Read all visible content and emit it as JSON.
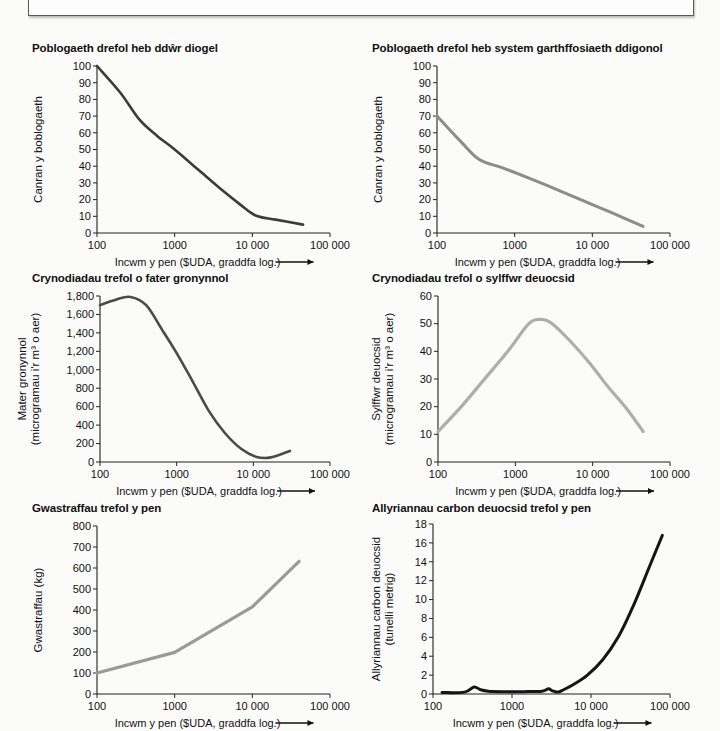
{
  "figure": {
    "top_box_label": "",
    "x_axis_title": "Incwm y pen ($UDA, graddfa log.)",
    "x_tick_labels": [
      "100",
      "1000",
      "10 000",
      "100 000"
    ]
  },
  "chart_data": [
    {
      "id": "chart-1",
      "type": "line",
      "title": "Poblogaeth drefol heb ddŵr diogel",
      "xlabel": "Incwm y pen ($UDA, graddfa log.)",
      "ylabel": "Canran y boblogaeth",
      "xscale": "log",
      "xlim": [
        100,
        100000
      ],
      "ylim": [
        0,
        100
      ],
      "xticks": [
        100,
        1000,
        10000,
        100000
      ],
      "xticklabels": [
        "100",
        "1000",
        "10 000",
        "100 000"
      ],
      "yticks": [
        0,
        10,
        20,
        30,
        40,
        50,
        60,
        70,
        80,
        90,
        100
      ],
      "yticklabels": [
        "0",
        "10",
        "20",
        "30",
        "40",
        "50",
        "60",
        "70",
        "80",
        "90",
        "100"
      ],
      "grid": false,
      "legend": "none",
      "color": "#3b3b3b",
      "linewidth": 2.6,
      "x": [
        100,
        200,
        350,
        600,
        1000,
        2000,
        4000,
        7000,
        11000,
        20000,
        45000
      ],
      "y": [
        100,
        84,
        68,
        58,
        50,
        38,
        26,
        17,
        10.5,
        8,
        5
      ]
    },
    {
      "id": "chart-2",
      "type": "line",
      "title": "Poblogaeth drefol heb system garthffosiaeth ddigonol",
      "xlabel": "Incwm y pen ($UDA, graddfa log.)",
      "ylabel": "Canran y boblogaeth",
      "xscale": "log",
      "xlim": [
        100,
        100000
      ],
      "ylim": [
        0,
        100
      ],
      "xticks": [
        100,
        1000,
        10000,
        100000
      ],
      "xticklabels": [
        "100",
        "1000",
        "10 000",
        "100 000"
      ],
      "yticks": [
        0,
        10,
        20,
        30,
        40,
        50,
        60,
        70,
        80,
        90,
        100
      ],
      "yticklabels": [
        "0",
        "10",
        "20",
        "30",
        "40",
        "50",
        "60",
        "70",
        "80",
        "90",
        "100"
      ],
      "grid": false,
      "legend": "none",
      "color": "#8c8c8c",
      "linewidth": 3.0,
      "x": [
        100,
        200,
        350,
        700,
        1500,
        3500,
        8000,
        18000,
        45000
      ],
      "y": [
        70,
        55,
        44,
        39,
        33,
        26,
        19,
        12,
        4
      ]
    },
    {
      "id": "chart-3",
      "type": "line",
      "title": "Crynodiadau trefol o fater gronynnol",
      "xlabel": "Incwm y pen ($UDA, graddfa log.)",
      "ylabel": "Mater gronynnol (microgramau i'r m³ o aer)",
      "xscale": "log",
      "xlim": [
        100,
        100000
      ],
      "ylim": [
        0,
        1800
      ],
      "xticks": [
        100,
        1000,
        10000,
        100000
      ],
      "xticklabels": [
        "100",
        "1000",
        "10 000",
        "100 000"
      ],
      "yticks": [
        0,
        200,
        400,
        600,
        800,
        1000,
        1200,
        1400,
        1600,
        1800
      ],
      "yticklabels": [
        "0",
        "200",
        "400",
        "600",
        "800",
        "1,000",
        "1,200",
        "1,400",
        "1,600",
        "1,800"
      ],
      "grid": false,
      "legend": "none",
      "color": "#4a4a4a",
      "linewidth": 2.6,
      "x": [
        100,
        160,
        250,
        400,
        650,
        1000,
        1600,
        2600,
        4200,
        7000,
        11000,
        17000,
        30000
      ],
      "y": [
        1700,
        1760,
        1790,
        1700,
        1430,
        1180,
        880,
        560,
        320,
        140,
        55,
        50,
        120
      ]
    },
    {
      "id": "chart-4",
      "type": "line",
      "title": "Crynodiadau trefol o sylffwr deuocsid",
      "xlabel": "Incwm y pen ($UDA, graddfa log.)",
      "ylabel": "Sylffwr deuocsid (microgramau i'r m³ o aer)",
      "xscale": "log",
      "xlim": [
        100,
        100000
      ],
      "ylim": [
        0,
        60
      ],
      "xticks": [
        100,
        1000,
        10000,
        100000
      ],
      "xticklabels": [
        "100",
        "1000",
        "10 000",
        "100 000"
      ],
      "yticks": [
        0,
        10,
        20,
        30,
        40,
        50,
        60
      ],
      "yticklabels": [
        "0",
        "10",
        "20",
        "30",
        "40",
        "50",
        "60"
      ],
      "grid": false,
      "legend": "none",
      "color": "#adadad",
      "linewidth": 3.2,
      "x": [
        100,
        200,
        400,
        800,
        1500,
        2200,
        3000,
        5000,
        9000,
        16000,
        28000,
        45000
      ],
      "y": [
        11,
        20,
        30,
        40,
        50,
        51.5,
        50,
        44,
        36,
        27,
        19,
        11
      ]
    },
    {
      "id": "chart-5",
      "type": "line",
      "title": "Gwastraffau trefol y pen",
      "xlabel": "Incwm y pen ($UDA, graddfa log.)",
      "ylabel": "Gwastraffau (kg)",
      "xscale": "log",
      "xlim": [
        100,
        100000
      ],
      "ylim": [
        0,
        800
      ],
      "xticks": [
        100,
        1000,
        10000,
        100000
      ],
      "xticklabels": [
        "100",
        "1000",
        "10 000",
        "100 000"
      ],
      "yticks": [
        0,
        100,
        200,
        300,
        400,
        500,
        600,
        700,
        800
      ],
      "yticklabels": [
        "0",
        "100",
        "200",
        "300",
        "400",
        "500",
        "600",
        "700",
        "800"
      ],
      "grid": false,
      "legend": "none",
      "color": "#9a9a9a",
      "linewidth": 3.2,
      "x": [
        100,
        1000,
        10000,
        40000
      ],
      "y": [
        100,
        198,
        415,
        632
      ]
    },
    {
      "id": "chart-6",
      "type": "line",
      "title": "Allyriannau carbon deuocsid trefol y pen",
      "xlabel": "Incwm y pen ($UDA, graddfa log.)",
      "ylabel": "Allyriannau carbon deuocsid (tunelli metrig)",
      "xscale": "log",
      "xlim": [
        100,
        100000
      ],
      "ylim": [
        0,
        18
      ],
      "xticks": [
        100,
        1000,
        10000,
        100000
      ],
      "xticklabels": [
        "100",
        "1000",
        "10 000",
        "100 000"
      ],
      "yticks": [
        0,
        2,
        4,
        6,
        8,
        10,
        12,
        14,
        16,
        18
      ],
      "yticklabels": [
        "0",
        "2",
        "4",
        "6",
        "8",
        "10",
        "12",
        "14",
        "16",
        "18"
      ],
      "grid": false,
      "legend": "none",
      "color": "#151515",
      "linewidth": 3.0,
      "x": [
        130,
        250,
        330,
        400,
        500,
        800,
        1400,
        2400,
        2900,
        3200,
        3800,
        4500,
        6000,
        9000,
        14000,
        22000,
        35000,
        55000,
        80000
      ],
      "y": [
        0.15,
        0.2,
        0.75,
        0.45,
        0.3,
        0.25,
        0.25,
        0.3,
        0.55,
        0.35,
        0.2,
        0.45,
        1.0,
        2.0,
        3.6,
        6.0,
        9.5,
        13.5,
        16.8
      ]
    }
  ]
}
